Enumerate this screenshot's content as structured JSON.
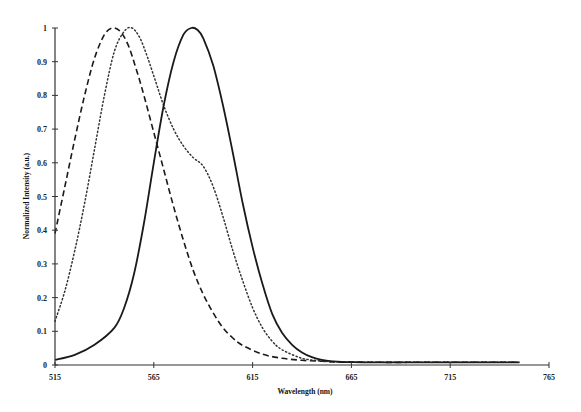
{
  "chart_data": {
    "type": "line",
    "title": "",
    "xlabel": "Wavelength (nm)",
    "ylabel": "Normalized Intensity (a.u.)",
    "xlim": [
      515,
      765
    ],
    "ylim": [
      0,
      1
    ],
    "xticks": [
      515,
      565,
      615,
      665,
      715,
      765
    ],
    "yticks": [
      0,
      0.1,
      0.2,
      0.3,
      0.4,
      0.5,
      0.6,
      0.7,
      0.8,
      0.9,
      1
    ],
    "grid": false,
    "legend": null,
    "series": [
      {
        "name": "dashed",
        "style": "dashed",
        "x": [
          515,
          520,
          525,
          530,
          535,
          540,
          544,
          548,
          552,
          556,
          560,
          565,
          570,
          575,
          580,
          585,
          590,
          595,
          600,
          605,
          610,
          620,
          630,
          640,
          650,
          660,
          680,
          700,
          720,
          740,
          750
        ],
        "y": [
          0.39,
          0.53,
          0.67,
          0.8,
          0.91,
          0.98,
          1.0,
          0.99,
          0.95,
          0.88,
          0.8,
          0.69,
          0.58,
          0.47,
          0.37,
          0.28,
          0.21,
          0.155,
          0.11,
          0.08,
          0.058,
          0.032,
          0.02,
          0.014,
          0.011,
          0.009,
          0.008,
          0.008,
          0.008,
          0.008,
          0.008
        ]
      },
      {
        "name": "dotted",
        "style": "dotted",
        "x": [
          515,
          520,
          525,
          530,
          535,
          540,
          545,
          550,
          554,
          558,
          562,
          566,
          570,
          575,
          580,
          585,
          590,
          595,
          600,
          605,
          610,
          615,
          620,
          625,
          630,
          640,
          650,
          660,
          680,
          700,
          720,
          740,
          750
        ],
        "y": [
          0.13,
          0.22,
          0.34,
          0.48,
          0.64,
          0.8,
          0.93,
          0.99,
          1.0,
          0.97,
          0.91,
          0.84,
          0.77,
          0.7,
          0.65,
          0.615,
          0.59,
          0.53,
          0.44,
          0.34,
          0.25,
          0.17,
          0.11,
          0.07,
          0.045,
          0.02,
          0.012,
          0.009,
          0.008,
          0.008,
          0.008,
          0.008,
          0.008
        ]
      },
      {
        "name": "solid",
        "style": "solid",
        "x": [
          515,
          525,
          535,
          545,
          550,
          555,
          560,
          565,
          570,
          575,
          580,
          584,
          587,
          590,
          595,
          600,
          605,
          610,
          615,
          620,
          625,
          630,
          635,
          640,
          645,
          650,
          655,
          660,
          670,
          680,
          700,
          720,
          740,
          750
        ],
        "y": [
          0.015,
          0.03,
          0.06,
          0.11,
          0.17,
          0.27,
          0.42,
          0.6,
          0.77,
          0.9,
          0.98,
          1.0,
          0.995,
          0.97,
          0.89,
          0.77,
          0.63,
          0.48,
          0.35,
          0.24,
          0.15,
          0.095,
          0.06,
          0.037,
          0.023,
          0.015,
          0.011,
          0.009,
          0.008,
          0.008,
          0.008,
          0.008,
          0.008,
          0.008
        ]
      }
    ]
  },
  "axis": {
    "x_title": "Wavelength (nm)",
    "y_title": "Normalized Intensity (a.u.)"
  }
}
